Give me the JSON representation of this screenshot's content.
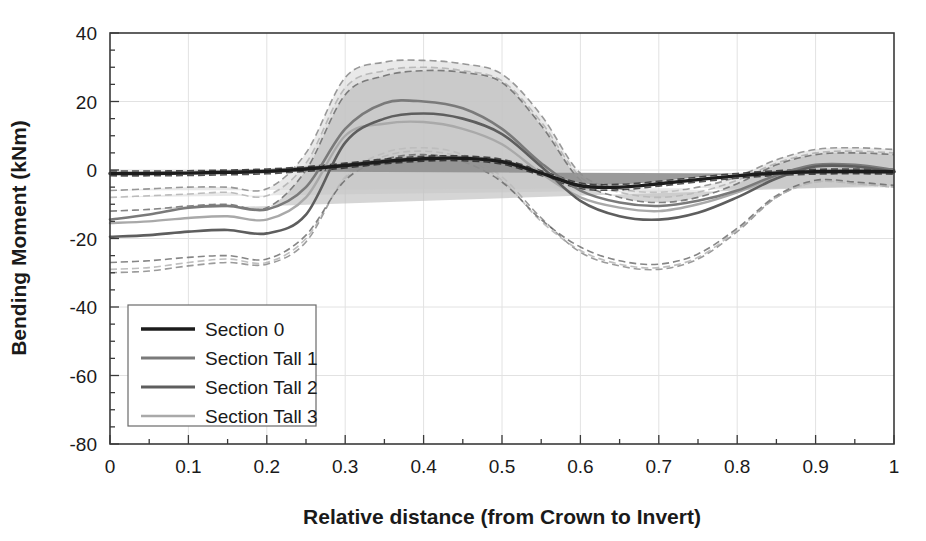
{
  "chart_data": {
    "type": "line",
    "title": "",
    "xlabel": "Relative distance (from Crown to Invert)",
    "ylabel": "Bending Moment (kNm)",
    "xlim": [
      0,
      1
    ],
    "ylim": [
      -80,
      40
    ],
    "xticks": [
      "0",
      "0.1",
      "0.2",
      "0.3",
      "0.4",
      "0.5",
      "0.6",
      "0.7",
      "0.8",
      "0.9",
      "1"
    ],
    "xtick_values": [
      0,
      0.1,
      0.2,
      0.3,
      0.4,
      0.5,
      0.6,
      0.7,
      0.8,
      0.9,
      1
    ],
    "yticks": [
      "40",
      "20",
      "0",
      "-20",
      "-40",
      "-60",
      "-80"
    ],
    "ytick_values": [
      40,
      20,
      0,
      -20,
      -40,
      -60,
      -80
    ],
    "minor_tick_step_x": 0.05,
    "minor_tick_step_y": 5,
    "grid": true,
    "legend_position": "lower left",
    "x": [
      0,
      0.05,
      0.1,
      0.15,
      0.2,
      0.25,
      0.3,
      0.35,
      0.4,
      0.45,
      0.5,
      0.55,
      0.6,
      0.65,
      0.7,
      0.75,
      0.8,
      0.85,
      0.9,
      0.95,
      1
    ],
    "series": [
      {
        "name": "Section 0",
        "color": "#1c1c1c",
        "width": 3.4,
        "values": [
          -1.0,
          -1.0,
          -0.9,
          -0.7,
          -0.4,
          0.3,
          1.3,
          2.5,
          3.3,
          3.4,
          2.4,
          -0.9,
          -4.6,
          -5.0,
          -4.0,
          -2.8,
          -1.7,
          -0.9,
          -0.5,
          -0.4,
          -0.5
        ],
        "band_upper": [
          -0.3,
          -0.3,
          -0.2,
          0.0,
          0.3,
          1.0,
          2.0,
          3.2,
          4.0,
          4.1,
          3.1,
          -0.2,
          -3.8,
          -4.2,
          -3.3,
          -2.1,
          -1.0,
          -0.2,
          0.2,
          0.3,
          0.2
        ],
        "band_lower": [
          -1.7,
          -1.7,
          -1.6,
          -1.4,
          -1.1,
          -0.4,
          0.6,
          1.8,
          2.6,
          2.7,
          1.7,
          -1.6,
          -5.4,
          -5.8,
          -4.7,
          -3.5,
          -2.4,
          -1.6,
          -1.2,
          -1.1,
          -1.2
        ]
      },
      {
        "name": "Section Tall 1",
        "color": "#7a7a7a",
        "width": 2.6,
        "values": [
          -14.5,
          -13.0,
          -11.0,
          -10.5,
          -11.5,
          -5.0,
          12.0,
          19.5,
          20.0,
          18.0,
          12.0,
          2.0,
          -6.0,
          -9.5,
          -10.5,
          -9.0,
          -6.0,
          -1.5,
          1.5,
          1.5,
          0.0
        ],
        "band_upper": [
          -6.0,
          -5.5,
          -5.0,
          -5.0,
          -5.5,
          5.0,
          27.0,
          31.5,
          32.0,
          31.0,
          28.0,
          16.0,
          -1.0,
          -5.5,
          -6.5,
          -5.0,
          -2.0,
          3.0,
          6.0,
          6.5,
          6.0
        ],
        "band_lower": [
          -30.0,
          -29.5,
          -28.0,
          -27.0,
          -27.5,
          -21.0,
          -2.0,
          5.0,
          6.5,
          4.5,
          -2.0,
          -14.0,
          -24.0,
          -28.0,
          -29.0,
          -26.0,
          -18.0,
          -8.0,
          -3.5,
          -4.0,
          -5.0
        ]
      },
      {
        "name": "Section Tall 2",
        "color": "#5e5e5e",
        "width": 2.6,
        "values": [
          -19.5,
          -19.0,
          -18.0,
          -17.5,
          -18.5,
          -13.0,
          8.0,
          15.0,
          16.5,
          15.0,
          10.5,
          1.0,
          -9.0,
          -13.5,
          -14.5,
          -12.5,
          -8.0,
          -2.5,
          1.0,
          1.0,
          -0.5
        ],
        "band_upper": [
          -12.0,
          -11.5,
          -10.5,
          -10.0,
          -11.0,
          0.0,
          22.0,
          27.5,
          29.0,
          28.5,
          25.5,
          13.0,
          -3.0,
          -8.0,
          -9.5,
          -8.0,
          -4.0,
          1.5,
          4.5,
          5.0,
          4.5
        ],
        "band_lower": [
          -27.0,
          -26.5,
          -25.5,
          -25.0,
          -26.0,
          -19.0,
          -3.0,
          3.0,
          4.5,
          2.5,
          -3.5,
          -14.5,
          -22.5,
          -26.5,
          -27.5,
          -24.5,
          -17.0,
          -7.5,
          -3.0,
          -3.5,
          -4.5
        ]
      },
      {
        "name": "Section Tall 3",
        "color": "#a9a9a9",
        "width": 2.4,
        "values": [
          -15.5,
          -15.0,
          -14.0,
          -13.5,
          -14.5,
          -8.0,
          10.0,
          13.5,
          14.0,
          12.0,
          7.5,
          -1.0,
          -8.0,
          -11.0,
          -12.0,
          -10.0,
          -6.5,
          -2.0,
          1.2,
          1.2,
          -0.3
        ],
        "band_upper": [
          -8.0,
          -7.5,
          -7.0,
          -6.5,
          -7.5,
          2.0,
          24.0,
          29.0,
          30.0,
          29.0,
          26.0,
          14.0,
          -2.0,
          -6.5,
          -8.0,
          -6.5,
          -3.0,
          2.0,
          5.0,
          5.5,
          5.0
        ],
        "band_lower": [
          -29.0,
          -28.5,
          -27.0,
          -26.0,
          -27.0,
          -20.0,
          -2.5,
          4.0,
          5.5,
          3.5,
          -3.0,
          -15.0,
          -23.5,
          -27.5,
          -28.5,
          -25.5,
          -17.5,
          -8.0,
          -3.5,
          -4.0,
          -5.0
        ]
      }
    ]
  },
  "legend": {
    "items": [
      {
        "label": "Section 0"
      },
      {
        "label": "Section Tall 1"
      },
      {
        "label": "Section Tall 2"
      },
      {
        "label": "Section Tall 3"
      }
    ]
  },
  "axes": {
    "y_title": "Bending Moment (kNm)",
    "x_title": "Relative distance (from Crown to Invert)"
  },
  "colors": {
    "band_light": "#dcdcdc",
    "band_mid": "#bcbcbc",
    "band_dark": "#9c9c9c",
    "frame": "#3a3a3a",
    "grid": "#e2e2e2",
    "text": "#1a1a1a"
  }
}
